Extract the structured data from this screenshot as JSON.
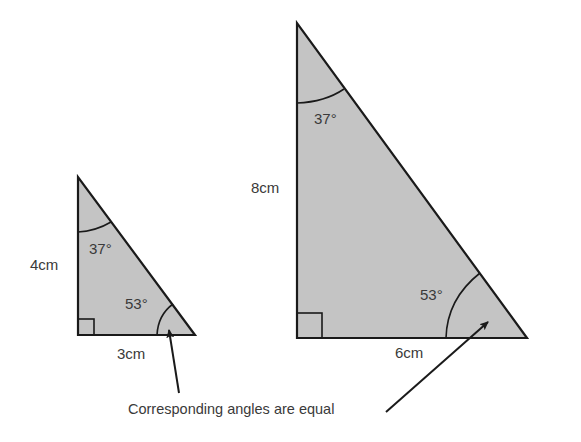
{
  "diagram": {
    "small_triangle": {
      "height_label": "4cm",
      "base_label": "3cm",
      "top_angle_label": "37°",
      "bottom_angle_label": "53°"
    },
    "large_triangle": {
      "height_label": "8cm",
      "base_label": "6cm",
      "top_angle_label": "37°",
      "bottom_angle_label": "53°"
    },
    "caption": "Corresponding angles are equal",
    "colors": {
      "fill": "#c4c4c4",
      "stroke": "#1a1a1a",
      "text": "#3a3a3a"
    }
  }
}
